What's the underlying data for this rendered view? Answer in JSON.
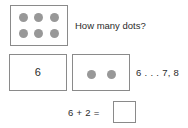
{
  "worksheet": {
    "question": "How many dots?",
    "count_on_hint": "6 . . . 7, 8",
    "equation": "6 + 2 =",
    "numeral_value": "6",
    "answer_value": "",
    "dot_color": "#989898",
    "border_color": "#8a8a8a",
    "text_color": "#2b2b2b",
    "background_color": "#ffffff"
  },
  "dot_boxes": {
    "six": {
      "label": "six-dots",
      "count": 6,
      "rows": 2,
      "columns": 3,
      "dots": [
        "dot",
        "dot",
        "dot",
        "dot",
        "dot",
        "dot"
      ]
    },
    "two": {
      "label": "two-dots",
      "count": 2,
      "rows": 1,
      "columns": 2,
      "dots": [
        "dot",
        "dot"
      ]
    }
  }
}
